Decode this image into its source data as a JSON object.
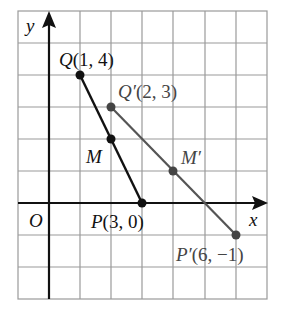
{
  "diagram": {
    "type": "coordinate-grid",
    "axes": {
      "x_label": "x",
      "y_label": "y",
      "origin_label": "O"
    },
    "grid": {
      "x_min": -1,
      "x_max": 7,
      "y_min": -3,
      "y_max": 6,
      "cell_px": 31.1
    },
    "points": [
      {
        "id": "Q",
        "name": "Q",
        "coords": "(1, 4)",
        "x": 1,
        "y": 4,
        "color": "#111111"
      },
      {
        "id": "P",
        "name": "P",
        "coords": "(3, 0)",
        "x": 3,
        "y": 0,
        "color": "#111111"
      },
      {
        "id": "M",
        "name": "M",
        "coords": "",
        "x": 2,
        "y": 2,
        "color": "#111111"
      },
      {
        "id": "Qp",
        "name": "Q′",
        "coords": "(2, 3)",
        "x": 2,
        "y": 3,
        "color": "#444444"
      },
      {
        "id": "Pp",
        "name": "P′",
        "coords": "(6, −1)",
        "x": 6,
        "y": -1,
        "color": "#444444"
      },
      {
        "id": "Mp",
        "name": "M′",
        "coords": "",
        "x": 4,
        "y": 1,
        "color": "#444444"
      }
    ],
    "segments": [
      {
        "from": "Q",
        "to": "P",
        "color": "#111111"
      },
      {
        "from": "Qp",
        "to": "Pp",
        "color": "#555555"
      }
    ],
    "labels": {
      "Q": "Q(1, 4)",
      "P": "P(3, 0)",
      "M": "M",
      "Qp": "Q′(2, 3)",
      "Pp": "P′(6, −1)",
      "Mp": "M′"
    }
  }
}
